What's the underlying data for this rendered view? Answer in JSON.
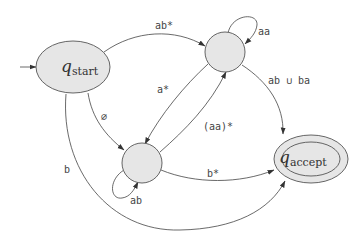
{
  "diagram": {
    "type": "generalized-nfa",
    "colors": {
      "state_fill": "#e6e6e6",
      "stroke": "#555555",
      "background": "#ffffff"
    },
    "states": [
      {
        "id": "start",
        "label_main": "q",
        "label_sub": "start",
        "shape": "ellipse",
        "initial": true,
        "accepting": false
      },
      {
        "id": "top",
        "label_main": "",
        "label_sub": "",
        "shape": "circle",
        "initial": false,
        "accepting": false
      },
      {
        "id": "middle",
        "label_main": "",
        "label_sub": "",
        "shape": "circle",
        "initial": false,
        "accepting": false
      },
      {
        "id": "accept",
        "label_main": "q",
        "label_sub": "accept",
        "shape": "double-ellipse",
        "initial": false,
        "accepting": true
      }
    ],
    "edges": [
      {
        "from": "start",
        "to": "top",
        "label": "ab*"
      },
      {
        "from": "top",
        "to": "top",
        "label": "aa"
      },
      {
        "from": "top",
        "to": "middle",
        "label": "a*"
      },
      {
        "from": "middle",
        "to": "top",
        "label": "(aa)*"
      },
      {
        "from": "start",
        "to": "middle",
        "label": "∅"
      },
      {
        "from": "top",
        "to": "accept",
        "label": "ab ∪ ba"
      },
      {
        "from": "middle",
        "to": "accept",
        "label": "b*"
      },
      {
        "from": "middle",
        "to": "middle",
        "label": "ab"
      },
      {
        "from": "start",
        "to": "accept",
        "label": "b"
      }
    ]
  }
}
